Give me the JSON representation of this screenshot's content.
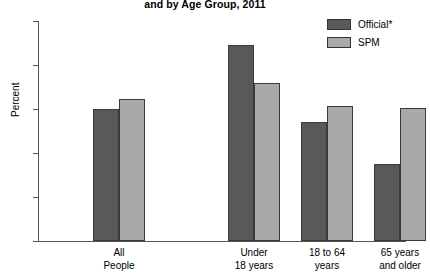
{
  "chart_data": {
    "type": "bar",
    "title": "and by Age Group, 2011",
    "xlabel": "",
    "ylabel": "Percent",
    "ylim": [
      0,
      25
    ],
    "yticks": [
      0,
      5,
      10,
      15,
      20,
      25
    ],
    "grid": false,
    "legend_position": "top-right",
    "categories": [
      "All People",
      "Under 18 years",
      "18 to 64 years",
      "65 years and older"
    ],
    "category_lines": [
      [
        "All",
        "People"
      ],
      [
        "Under",
        "18 years"
      ],
      [
        "18 to 64",
        "years"
      ],
      [
        "65 years",
        "and older"
      ]
    ],
    "series": [
      {
        "name": "Official*",
        "color": "#59595b",
        "values": [
          15.0,
          22.3,
          13.5,
          8.7
        ]
      },
      {
        "name": "SPM",
        "color": "#a9a9ab",
        "values": [
          16.1,
          18.0,
          15.3,
          15.1
        ]
      }
    ]
  },
  "legend": {
    "items": [
      {
        "label": "Official*",
        "color": "#59595b"
      },
      {
        "label": "SPM",
        "color": "#a9a9ab"
      }
    ]
  },
  "axis": {
    "y_title": "Percent",
    "y_tick_labels": [
      "25",
      "20",
      "15",
      "10",
      "5",
      "0"
    ]
  }
}
